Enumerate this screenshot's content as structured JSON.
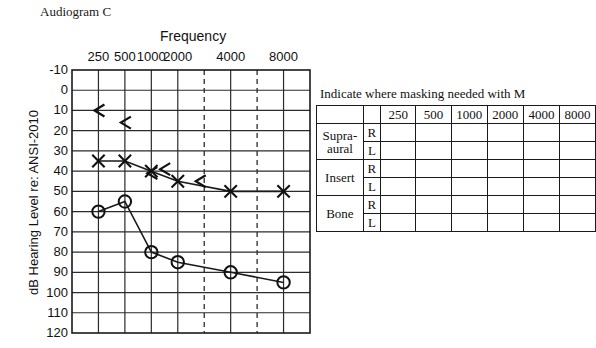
{
  "title": "Audiogram C",
  "chart_data": {
    "type": "line",
    "title": "Audiogram C",
    "xlabel": "Frequency",
    "ylabel": "dB Hearing Level re: ANSI-2010",
    "categories": [
      "250",
      "500",
      "1000",
      "2000",
      "4000",
      "8000"
    ],
    "xticks": [
      "250",
      "500",
      "1000",
      "2000",
      "4000",
      "8000"
    ],
    "yticks": [
      "-10",
      "0",
      "10",
      "20",
      "30",
      "40",
      "50",
      "60",
      "70",
      "80",
      "90",
      "100",
      "110",
      "120"
    ],
    "ylim": [
      -10,
      120
    ],
    "y_inverted": true,
    "grid": true,
    "interoctave_dashed": [
      "3000",
      "6000"
    ],
    "series": [
      {
        "name": "Left ear air conduction (X)",
        "symbol": "X",
        "frequencies": [
          250,
          500,
          1000,
          2000,
          4000,
          8000
        ],
        "values": [
          35,
          35,
          40,
          45,
          50,
          50
        ]
      },
      {
        "name": "Right ear air conduction (O)",
        "symbol": "O",
        "frequencies": [
          250,
          500,
          1000,
          2000,
          4000,
          8000
        ],
        "values": [
          60,
          55,
          80,
          85,
          90,
          95
        ]
      },
      {
        "name": "Masking arrow markers",
        "symbol": "<",
        "points": [
          {
            "freq": 250,
            "db": 10
          },
          {
            "freq": 500,
            "db": 16
          },
          {
            "freq": 1000,
            "db": 41
          },
          {
            "freq": 1400,
            "db": 39
          },
          {
            "freq": 2800,
            "db": 45
          }
        ]
      }
    ]
  },
  "mask_table": {
    "caption": "Indicate where masking needed with M",
    "corner_label": "",
    "ear_header": "",
    "columns": [
      "250",
      "500",
      "1000",
      "2000",
      "4000",
      "8000"
    ],
    "rows": [
      {
        "category": "Supra-",
        "category2": "aural",
        "ears": [
          "R",
          "L"
        ]
      },
      {
        "category": "Insert",
        "category2": "",
        "ears": [
          "R",
          "L"
        ]
      },
      {
        "category": "Bone",
        "category2": "",
        "ears": [
          "R",
          "L"
        ]
      }
    ]
  },
  "colors": {
    "line": "#1a1a1a",
    "grid": "#2b2b2b",
    "text": "#111111",
    "background": "#ffffff"
  }
}
